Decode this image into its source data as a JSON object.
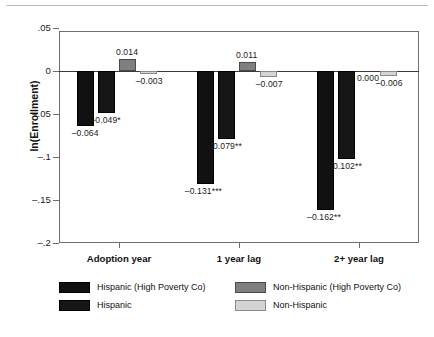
{
  "chart_data": {
    "type": "bar",
    "title": "",
    "xlabel": "",
    "ylabel": "ln(Enrollment)",
    "ylim": [
      -0.2,
      0.05
    ],
    "yticks": [
      0.05,
      0,
      -0.05,
      -0.1,
      -0.15,
      -0.2
    ],
    "ytick_labels": [
      ".05",
      "0",
      "–.05",
      "–.1",
      "–.15",
      "–.2"
    ],
    "grid": false,
    "legend_position": "below-plot",
    "categories": [
      "Adoption year",
      "1 year lag",
      "2+ year lag"
    ],
    "series": [
      {
        "name": "Hispanic (High Poverty Co)",
        "key": "hispanic_high_poverty",
        "color": "#111111",
        "values": [
          -0.064,
          -0.131,
          -0.162
        ],
        "labels": [
          "–0.064",
          "–0.131***",
          "–0.162**"
        ]
      },
      {
        "name": "Hispanic",
        "key": "hispanic",
        "color": "#161616",
        "values": [
          -0.049,
          -0.079,
          -0.102
        ],
        "labels": [
          "–0.049*",
          "–0.079**",
          "–0.102**"
        ]
      },
      {
        "name": "Non-Hispanic (High Poverty Co)",
        "key": "non_hispanic_high_poverty",
        "color": "#7f7f7f",
        "values": [
          0.014,
          0.011,
          0.0
        ],
        "labels": [
          "0.014",
          "0.011",
          "0.000"
        ]
      },
      {
        "name": "Non-Hispanic",
        "key": "non_hispanic",
        "color": "#d4d4d4",
        "values": [
          -0.003,
          -0.007,
          -0.006
        ],
        "labels": [
          "–0.003",
          "–0.007",
          "–0.006"
        ]
      }
    ]
  },
  "axis": {
    "y_label": "ln(Enrollment)",
    "y_ticks": [
      {
        "value": 0.05,
        "label": ".05"
      },
      {
        "value": 0.0,
        "label": "0"
      },
      {
        "value": -0.05,
        "label": "–.05"
      },
      {
        "value": -0.1,
        "label": "–.1"
      },
      {
        "value": -0.15,
        "label": "–.15"
      },
      {
        "value": -0.2,
        "label": "–.2"
      }
    ],
    "x_categories": [
      "Adoption year",
      "1 year lag",
      "2+ year lag"
    ]
  },
  "legend": {
    "entries": [
      {
        "label": "Hispanic (High Poverty Co)",
        "swatch": "s-hh"
      },
      {
        "label": "Hispanic",
        "swatch": "s-h"
      },
      {
        "label": "Non-Hispanic (High Poverty Co)",
        "swatch": "s-nhh"
      },
      {
        "label": "Non-Hispanic",
        "swatch": "s-nh"
      }
    ]
  },
  "colors": {
    "hispanic_high_poverty": "#111111",
    "hispanic": "#161616",
    "non_hispanic_high_poverty": "#7f7f7f",
    "non_hispanic": "#d4d4d4",
    "axis": "#6e6e6e",
    "zero_line": "#3a3a3a"
  }
}
